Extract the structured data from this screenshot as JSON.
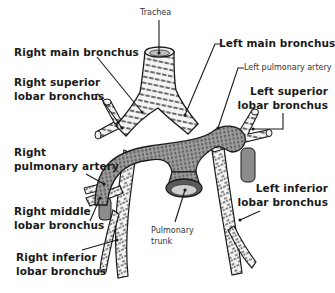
{
  "figure": {
    "labels": {
      "trachea": "Trachea",
      "right_main_bronchus": "Right main bronchus",
      "right_superior_lobar_1": "Right superior",
      "right_superior_lobar_2": "lobar bronchus",
      "right_pulmonary_artery_1": "Right",
      "right_pulmonary_artery_2": "pulmonary artery",
      "right_middle_lobar_1": "Right middle",
      "right_middle_lobar_2": "lobar bronchus",
      "right_inferior_lobar_1": "Right inferior",
      "right_inferior_lobar_2": "lobar bronchus",
      "left_main_bronchus": "Left main bronchus",
      "left_pulmonary_artery": "Left pulmonary artery",
      "left_superior_lobar_1": "Left superior",
      "left_superior_lobar_2": "lobar bronchus",
      "left_inferior_lobar_1": "Left inferior",
      "left_inferior_lobar_2": "lobar bronchus",
      "pulmonary_trunk_1": "Pulmonary",
      "pulmonary_trunk_2": "trunk"
    },
    "colors": {
      "ink": "#1a1a1a",
      "artery_fill": "#9a9a9a",
      "bronchus_fill": "#f2f2f2",
      "background": "#ffffff"
    }
  }
}
